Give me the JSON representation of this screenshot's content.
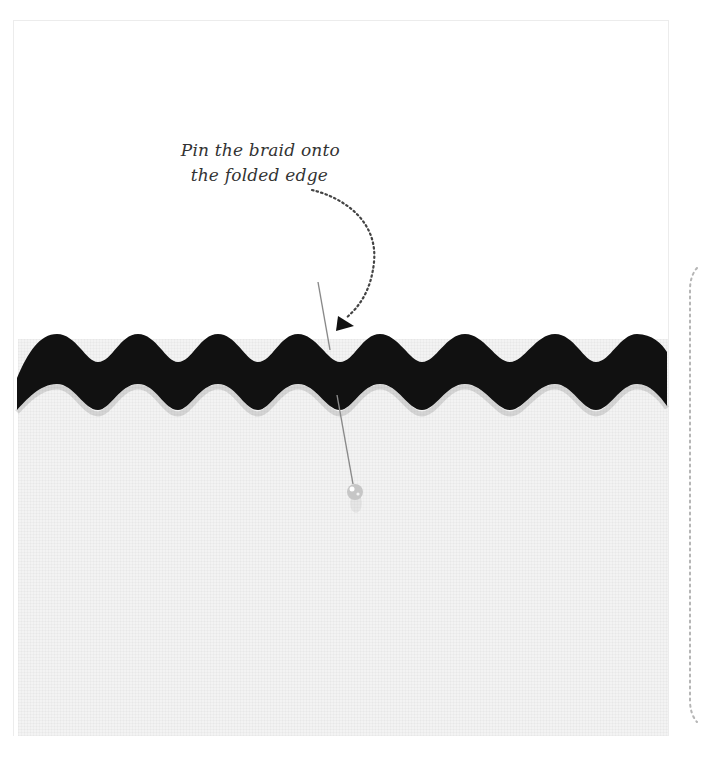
{
  "figure": {
    "annotation": {
      "line1": "Pin the braid onto",
      "line2": "the folded edge"
    },
    "colors": {
      "background": "#ffffff",
      "fabric": "#f3f3f3",
      "braid": "#111111",
      "annotation_text": "#333333",
      "dotted_arrow": "#444444",
      "side_dotted_line": "#b5b5b5",
      "pin_shaft": "#888888",
      "pin_head": "#c9c9c9"
    },
    "elements": {
      "braid": "black-ric-rac-braid",
      "pin": "straight-pin-with-pearl-head",
      "arrow": "curved-dotted-arrow"
    }
  }
}
